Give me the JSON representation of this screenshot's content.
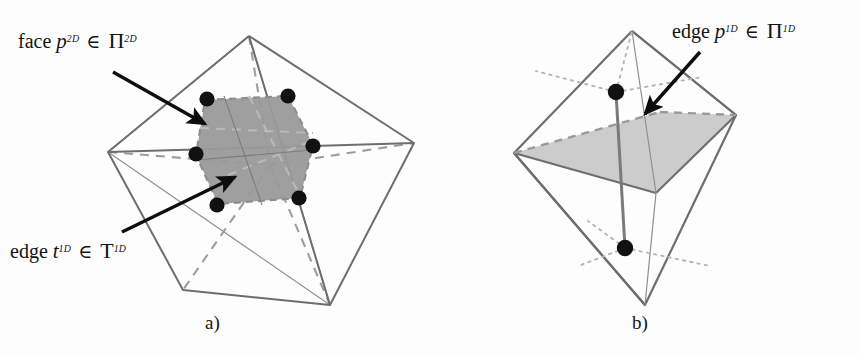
{
  "figure": {
    "background_color": "#fdfdfd",
    "width": 858,
    "height": 357
  },
  "colors": {
    "ink": "#141414",
    "solid_edge": "#6e6e6e",
    "thin_edge": "#8a8a8a",
    "dashed_edge": "#9a9a9a",
    "dotted_edge": "#b4b4b4",
    "shade_dark": "#9a9a9a",
    "shade_light": "#c9c9c9",
    "shade_light_edge": "#8f8f8f",
    "marker": "#111111",
    "arrow": "#0d0d0d"
  },
  "labels": {
    "face_p2d": {
      "word": "face",
      "symbol": "p",
      "symbol_sup": "2D",
      "operator": "∈",
      "set": "Π",
      "set_sup": "2D",
      "plain": "face p2D ∈ Π2D"
    },
    "edge_t1d": {
      "word": "edge",
      "symbol": "t",
      "symbol_sup": "1D",
      "operator": "∈",
      "set": "T",
      "set_sup": "1D",
      "plain": "edge t1D ∈ T1D"
    },
    "edge_p1d": {
      "word": "edge",
      "symbol": "p",
      "symbol_sup": "1D",
      "operator": "∈",
      "set": "Π",
      "set_sup": "1D",
      "plain": "edge p1D ∈ Π1D"
    }
  },
  "captions": {
    "panel_a": "a)",
    "panel_b": "b)"
  },
  "panel_a": {
    "name": "hexagonal-cut-face-panel",
    "description": "Two tetrahedra sharing an edge, cut by a shaded hexagonal face with six node markers",
    "outer_solid_polylines": [
      [
        [
          249,
          36
        ],
        [
          108,
          152
        ],
        [
          183,
          290
        ],
        [
          330,
          305
        ],
        [
          249,
          36
        ]
      ],
      [
        [
          249,
          36
        ],
        [
          414,
          143
        ],
        [
          330,
          305
        ]
      ],
      [
        [
          108,
          152
        ],
        [
          414,
          143
        ]
      ]
    ],
    "thin_polylines": [
      [
        [
          108,
          152
        ],
        [
          249,
          36
        ],
        [
          330,
          305
        ]
      ],
      [
        [
          108,
          152
        ],
        [
          330,
          305
        ]
      ],
      [
        [
          249,
          36
        ],
        [
          330,
          305
        ]
      ]
    ],
    "dashed_polylines": [
      [
        [
          108,
          152
        ],
        [
          270,
          165
        ],
        [
          414,
          143
        ]
      ],
      [
        [
          249,
          36
        ],
        [
          270,
          165
        ],
        [
          183,
          290
        ]
      ],
      [
        [
          270,
          165
        ],
        [
          330,
          305
        ]
      ]
    ],
    "shaded_hexagon": [
      [
        205,
        100
      ],
      [
        288,
        96
      ],
      [
        313,
        145
      ],
      [
        300,
        198
      ],
      [
        218,
        204
      ],
      [
        196,
        155
      ]
    ],
    "nodes": [
      [
        207,
        99
      ],
      [
        288,
        96
      ],
      [
        313,
        146
      ],
      [
        299,
        198
      ],
      [
        217,
        205
      ],
      [
        196,
        154
      ]
    ],
    "arrows": [
      {
        "name": "arrow-to-face",
        "from": [
          113,
          72
        ],
        "to": [
          208,
          126
        ]
      },
      {
        "name": "arrow-to-edge",
        "from": [
          122,
          232
        ],
        "to": [
          238,
          175
        ]
      }
    ]
  },
  "panel_b": {
    "name": "shared-edge-panel",
    "description": "Two tetrahedra joined on a shaded quadrilateral face, with two node markers joined by a segment and dotted rays",
    "outer_solid_polylines": [
      [
        [
          632,
          31
        ],
        [
          514,
          153
        ],
        [
          645,
          305
        ],
        [
          736,
          115
        ],
        [
          632,
          31
        ]
      ],
      [
        [
          514,
          153
        ],
        [
          645,
          305
        ]
      ],
      [
        [
          632,
          31
        ],
        [
          736,
          115
        ]
      ]
    ],
    "shaded_quad": [
      [
        514,
        153
      ],
      [
        660,
        112
      ],
      [
        736,
        115
      ],
      [
        656,
        193
      ]
    ],
    "dashed_top_edges": [
      [
        [
          514,
          153
        ],
        [
          660,
          112
        ]
      ],
      [
        [
          660,
          112
        ],
        [
          736,
          115
        ]
      ]
    ],
    "thin_polylines": [
      [
        [
          632,
          31
        ],
        [
          656,
          193
        ]
      ],
      [
        [
          656,
          193
        ],
        [
          645,
          305
        ]
      ]
    ],
    "dotted_rays_upper": [
      [
        [
          616,
          92
        ],
        [
          540,
          72
        ]
      ],
      [
        [
          616,
          92
        ],
        [
          632,
          31
        ]
      ],
      [
        [
          616,
          92
        ],
        [
          700,
          78
        ]
      ]
    ],
    "dotted_rays_lower": [
      [
        [
          625,
          248
        ],
        [
          586,
          222
        ]
      ],
      [
        [
          625,
          248
        ],
        [
          585,
          260
        ]
      ],
      [
        [
          625,
          248
        ],
        [
          706,
          265
        ]
      ]
    ],
    "nodes": [
      [
        616,
        92
      ],
      [
        625,
        248
      ]
    ],
    "connector_segment": [
      [
        616,
        92
      ],
      [
        625,
        248
      ]
    ],
    "arrows": [
      {
        "name": "arrow-to-edge-p1d",
        "from": [
          700,
          52
        ],
        "to": [
          642,
          118
        ]
      }
    ]
  }
}
